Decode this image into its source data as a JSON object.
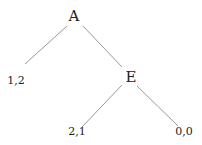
{
  "tree": {
    "nodes": [
      {
        "id": "A",
        "label": "A",
        "x": 74,
        "y": 16,
        "type": "decision"
      },
      {
        "id": "E",
        "label": "E",
        "x": 131,
        "y": 77,
        "type": "decision"
      },
      {
        "id": "L1",
        "label": "1,2",
        "x": 16,
        "y": 80,
        "type": "payoff"
      },
      {
        "id": "L2",
        "label": "2,1",
        "x": 77,
        "y": 131,
        "type": "payoff"
      },
      {
        "id": "L3",
        "label": "0,0",
        "x": 184,
        "y": 131,
        "type": "payoff"
      }
    ],
    "edges": [
      {
        "from": "A",
        "to": "L1"
      },
      {
        "from": "A",
        "to": "E"
      },
      {
        "from": "E",
        "to": "L2"
      },
      {
        "from": "E",
        "to": "L3"
      }
    ]
  }
}
